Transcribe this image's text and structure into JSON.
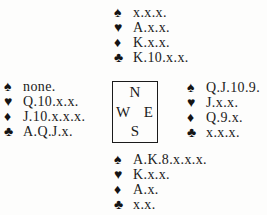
{
  "diagram": {
    "kind": "bridge-deal",
    "background": "#fdfdfc",
    "text_color": "#1b1b1b",
    "border_color": "#1b1b1b"
  },
  "compass": {
    "north": "N",
    "west": "W",
    "east": "E",
    "south": "S"
  },
  "hands": {
    "north": [
      {
        "suit": "spade",
        "symbol": "♠",
        "cards": "x.x.x."
      },
      {
        "suit": "heart",
        "symbol": "♥",
        "cards": "A.x.x."
      },
      {
        "suit": "diamond",
        "symbol": "♦",
        "cards": "K.x.x."
      },
      {
        "suit": "club",
        "symbol": "♣",
        "cards": "K.10.x.x."
      }
    ],
    "west": [
      {
        "suit": "spade",
        "symbol": "♠",
        "cards": "none."
      },
      {
        "suit": "heart",
        "symbol": "♥",
        "cards": "Q.10.x.x."
      },
      {
        "suit": "diamond",
        "symbol": "♦",
        "cards": "J.10.x.x.x."
      },
      {
        "suit": "club",
        "symbol": "♣",
        "cards": "A.Q.J.x."
      }
    ],
    "east": [
      {
        "suit": "spade",
        "symbol": "♠",
        "cards": "Q.J.10.9."
      },
      {
        "suit": "heart",
        "symbol": "♥",
        "cards": "J.x.x."
      },
      {
        "suit": "diamond",
        "symbol": "♦",
        "cards": "Q.9.x."
      },
      {
        "suit": "club",
        "symbol": "♣",
        "cards": "x.x.x."
      }
    ],
    "south": [
      {
        "suit": "spade",
        "symbol": "♠",
        "cards": "A.K.8.x.x.x."
      },
      {
        "suit": "heart",
        "symbol": "♥",
        "cards": "K.x.x."
      },
      {
        "suit": "diamond",
        "symbol": "♦",
        "cards": "A.x."
      },
      {
        "suit": "club",
        "symbol": "♣",
        "cards": "x.x."
      }
    ]
  }
}
